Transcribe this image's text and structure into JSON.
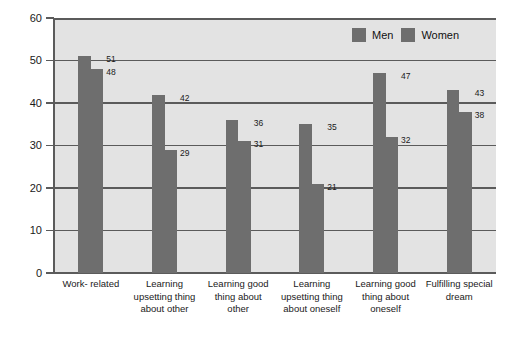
{
  "chart_data": {
    "type": "bar",
    "title": "",
    "subtitle": "",
    "xlabel": "",
    "ylabel": "Percentage reporting",
    "ylim": [
      0,
      60
    ],
    "yticks": [
      0,
      10,
      20,
      30,
      40,
      50,
      60
    ],
    "ytick_labels": [
      "0",
      "10",
      "20",
      "30",
      "40",
      "50",
      "60"
    ],
    "grid": true,
    "grid_axis": "y",
    "legend_position": "top-right",
    "categories": [
      "Work- related",
      "Learning upsetting thing about other",
      "Learning good thing about other",
      "Learning upsetting thing about oneself",
      "Learning good thing about oneself",
      "Fulfilling special dream"
    ],
    "category_lines": [
      [
        "Work- related"
      ],
      [
        "Learning",
        "upsetting thing",
        "about other"
      ],
      [
        "Learning good",
        "thing about",
        "other"
      ],
      [
        "Learning",
        "upsetting thing",
        "about oneself"
      ],
      [
        "Learning good",
        "thing about",
        "oneself"
      ],
      [
        "Fulfilling special",
        "dream"
      ]
    ],
    "series": [
      {
        "name": "Men",
        "color": "#6e6e6e",
        "values": [
          51,
          42,
          36,
          35,
          47,
          43
        ]
      },
      {
        "name": "Women",
        "color": "#6e6e6e",
        "values": [
          48,
          29,
          31,
          21,
          32,
          38
        ]
      }
    ],
    "legend": [
      "Men",
      "Women"
    ],
    "value_labels": [
      [
        "51",
        "48"
      ],
      [
        "42",
        "29"
      ],
      [
        "36",
        "31"
      ],
      [
        "35",
        "21"
      ],
      [
        "47",
        "32"
      ],
      [
        "43",
        "38"
      ]
    ]
  },
  "colors": {
    "plot_background": "#e3e3e3",
    "page_background": "#ffffff",
    "bar": "#6e6e6e",
    "axis": "#5b5b5b",
    "text": "#1a1a1a"
  }
}
